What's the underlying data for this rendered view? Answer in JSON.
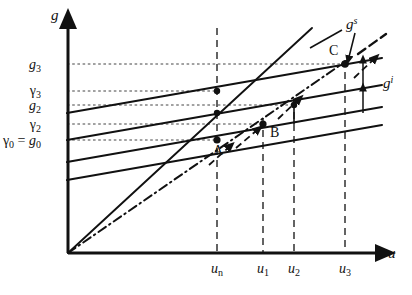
{
  "figure": {
    "axes": {
      "x_axis_label": "u",
      "y_axis_label": "g",
      "origin_label": ""
    },
    "y_ticks": [
      {
        "id": "g3",
        "label": "g3",
        "display": "g",
        "sub": "3",
        "y": 64
      },
      {
        "id": "gamma3",
        "label": "γ3",
        "display": "γ",
        "sub": "3",
        "y": 91
      },
      {
        "id": "g2",
        "label": "g2",
        "display": "g",
        "sub": "2",
        "y": 105
      },
      {
        "id": "gamma2",
        "label": "γ2",
        "display": "γ",
        "sub": "2",
        "y": 124
      },
      {
        "id": "gamma0",
        "label": "γ0 = g0",
        "display": "γ",
        "sub": "0",
        "y": 140
      }
    ],
    "x_ticks": [
      {
        "id": "un",
        "display": "u",
        "sub": "n",
        "x": 217
      },
      {
        "id": "u1",
        "display": "u",
        "sub": "1",
        "x": 263
      },
      {
        "id": "u2",
        "display": "u",
        "sub": "2",
        "x": 294
      },
      {
        "id": "u3",
        "display": "u",
        "sub": "3",
        "x": 345
      }
    ],
    "curves": [
      {
        "id": "gs",
        "display": "g",
        "sup": "s",
        "label": "gs",
        "style": "dash-dot",
        "description": "supply schedule through origin"
      },
      {
        "id": "gi",
        "display": "g",
        "sup": "i",
        "label": "gi",
        "style": "solid",
        "description": "family of parallel inflation-expectation lines"
      }
    ],
    "points": [
      {
        "id": "A",
        "label": "A",
        "x": 217,
        "y": 140
      },
      {
        "id": "B",
        "label": "B",
        "x": 263,
        "y": 124
      },
      {
        "id": "C",
        "label": "C",
        "x": 345,
        "y": 64
      }
    ],
    "colors": {
      "ink": "#111111",
      "background": "#ffffff",
      "gridline": "#555555"
    }
  }
}
